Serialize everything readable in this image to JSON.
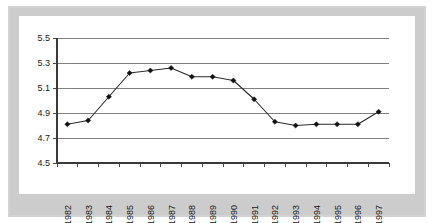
{
  "figure": {
    "frame_color": "#d3d3d3",
    "plot_background": "#ffffff",
    "line_color": "#2b2b2b",
    "marker_color": "#111111",
    "grid_color": "#808080",
    "axis_color": "#3a3a3a"
  },
  "chart_data": {
    "type": "line",
    "title": "",
    "subtitle": "",
    "xlabel": "",
    "ylabel": "",
    "categories": [
      "1982",
      "1983",
      "1984",
      "1985",
      "1986",
      "1987",
      "1988",
      "1989",
      "1990",
      "1991",
      "1992",
      "1993",
      "1994",
      "1995",
      "1996",
      "1997"
    ],
    "values": [
      4.81,
      4.84,
      5.03,
      5.22,
      5.24,
      5.26,
      5.19,
      5.19,
      5.16,
      5.01,
      4.83,
      4.8,
      4.81,
      4.81,
      4.81,
      4.91
    ],
    "series": [
      {
        "name": "",
        "values": [
          4.81,
          4.84,
          5.03,
          5.22,
          5.24,
          5.26,
          5.19,
          5.19,
          5.16,
          5.01,
          4.83,
          4.8,
          4.81,
          4.81,
          4.81,
          4.91
        ]
      }
    ],
    "ylim": [
      4.5,
      5.5
    ],
    "yticks": [
      4.5,
      4.7,
      4.9,
      5.1,
      5.3,
      5.5
    ],
    "ytick_labels": [
      "4.5",
      "4.7",
      "4.9",
      "5.1",
      "5.3",
      "5.5"
    ],
    "xtick_labels": [
      "1982",
      "1983",
      "1984",
      "1985",
      "1986",
      "1987",
      "1988",
      "1989",
      "1990",
      "1991",
      "1992",
      "1993",
      "1994",
      "1995",
      "1996",
      "1997"
    ],
    "xtick_rotation": -90,
    "grid": "horizontal",
    "legend": "none",
    "markers": "diamond",
    "annotations": []
  },
  "layout": {
    "plot_left": 57,
    "plot_right": 389,
    "plot_top": 38,
    "plot_bottom": 163
  }
}
